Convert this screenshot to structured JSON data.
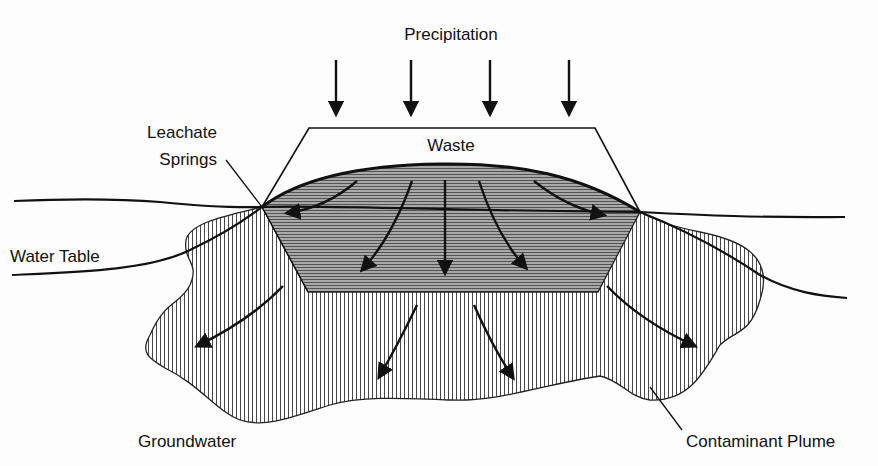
{
  "diagram": {
    "type": "landfill-leachate-cross-section",
    "labels": {
      "precipitation": "Precipitation",
      "waste": "Waste",
      "leachate_springs_line1": "Leachate",
      "leachate_springs_line2": "Springs",
      "water_table": "Water Table",
      "groundwater": "Groundwater",
      "contaminant_plume": "Contaminant Plume"
    },
    "precipitation_arrow_count": 4,
    "leachate_flow_arrow_count": 5,
    "plume_flow_arrow_count": 4,
    "colors": {
      "ink": "#111111",
      "leachate_fill": "#9a9a9a",
      "plume_hatch": "#333333",
      "background": "#fdfdfd"
    }
  }
}
